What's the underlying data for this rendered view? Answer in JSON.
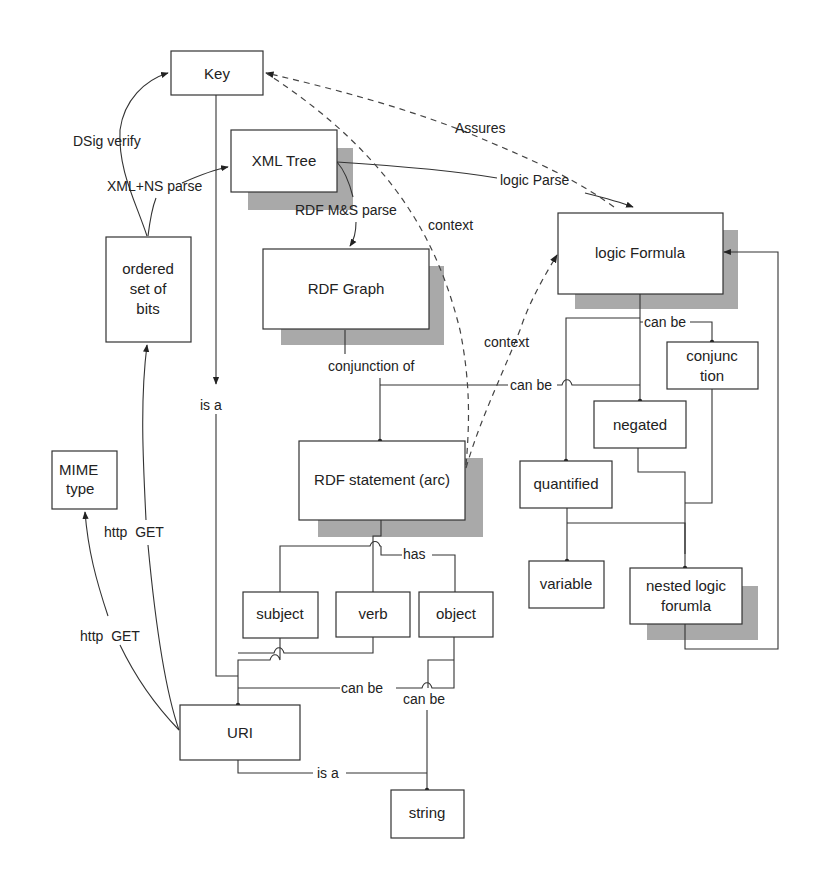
{
  "diagram": {
    "nodes": {
      "key": {
        "label": "Key"
      },
      "xml_tree": {
        "label": "XML Tree"
      },
      "ordered_bits": {
        "lines": [
          "ordered",
          "set of",
          "bits"
        ]
      },
      "rdf_graph": {
        "label": "RDF Graph"
      },
      "logic_formula": {
        "label": "logic Formula"
      },
      "conjunction": {
        "lines": [
          "conjunc",
          "tion"
        ]
      },
      "negated": {
        "label": "negated"
      },
      "quantified": {
        "label": "quantified"
      },
      "variable": {
        "label": "variable"
      },
      "nested_logic": {
        "lines": [
          "nested logic",
          "forumla"
        ]
      },
      "rdf_statement": {
        "label": "RDF statement (arc)"
      },
      "mime_type": {
        "lines": [
          "MIME",
          "type"
        ]
      },
      "subject": {
        "label": "subject"
      },
      "verb": {
        "label": "verb"
      },
      "object": {
        "label": "object"
      },
      "uri": {
        "label": "URI"
      },
      "string": {
        "label": "string"
      }
    },
    "edges": {
      "dsig_verify": "DSig verify",
      "xml_ns_parse": "XML+NS parse",
      "assures": "Assures",
      "logic_parse": "logic Parse",
      "rdf_ms_parse": "RDF M&S parse",
      "context_1": "context",
      "context_2": "context",
      "conjunction_of": "conjunction of",
      "can_be_statement": "can be",
      "can_be_logic": "can be",
      "is_a_key": "is a",
      "http_get_1": "http  GET",
      "http_get_2": "http  GET",
      "has": "has",
      "can_be_uri": "can be",
      "can_be_string": "can be",
      "is_a_string": "is a"
    }
  }
}
